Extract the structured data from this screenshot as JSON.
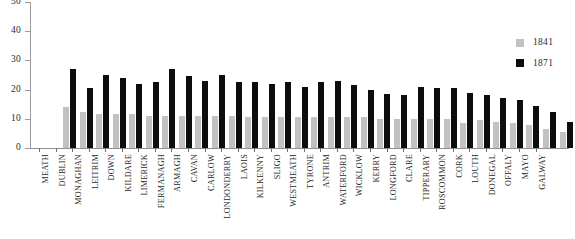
{
  "chart_data": {
    "type": "bar",
    "title": "",
    "subtitle": "",
    "xlabel": "",
    "ylabel": "",
    "ylim": [
      0,
      50
    ],
    "yticks": [
      0,
      10,
      20,
      30,
      40,
      50
    ],
    "grid": false,
    "legend_position": "right",
    "categories": [
      "MEATH",
      "DUBLIN",
      "MONAGHAN",
      "LEITRIM",
      "DOWN",
      "KILDARE",
      "LIMERICK",
      "FERMANAGH",
      "ARMAGH",
      "CAVAN",
      "CARLOW",
      "LONDONDERRY",
      "LAOIS",
      "KILKENNY",
      "SLIGO",
      "WESTMEATH",
      "TYRONE",
      "ANTRIM",
      "WATERFORD",
      "WICKLOW",
      "KERRY",
      "LONGFORD",
      "CLARE",
      "TIPPERARY",
      "ROSCOMMON",
      "CORK",
      "LOUTH",
      "DONEGAL",
      "OFFALY",
      "MAYO",
      "GALWAY"
    ],
    "series": [
      {
        "name": "1841",
        "color": "#c2c2c2",
        "values": [
          14,
          12.5,
          11.5,
          11.5,
          11.5,
          11,
          11,
          11,
          11,
          11,
          11,
          10.5,
          10.5,
          10.5,
          10.5,
          10.5,
          10.5,
          10.5,
          10.5,
          10,
          10,
          10,
          10,
          10,
          8.5,
          9.5,
          9,
          8.5,
          8,
          6.5,
          5.5
        ]
      },
      {
        "name": "1871",
        "color": "#0d0d0d",
        "values": [
          27,
          20.5,
          25,
          24,
          22,
          22.5,
          27,
          24.5,
          23,
          25,
          22.5,
          22.5,
          22,
          22.5,
          21,
          22.5,
          23,
          21.5,
          20,
          18.5,
          18,
          21,
          20.5,
          20.5,
          19,
          18,
          17,
          16.5,
          14.5,
          12.5,
          9
        ]
      }
    ]
  },
  "legend": {
    "entries": [
      {
        "label": "1841",
        "color": "#c2c2c2"
      },
      {
        "label": "1871",
        "color": "#0d0d0d"
      }
    ]
  }
}
